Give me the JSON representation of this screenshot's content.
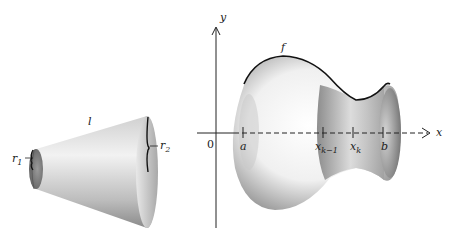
{
  "frustum": {
    "slant_label": "l",
    "r1_label": "r",
    "r1_sub": "1",
    "r2_label": "r",
    "r2_sub": "2"
  },
  "solid": {
    "y_axis_label": "y",
    "x_axis_label": "x",
    "origin_label": "0",
    "curve_label": "f",
    "ticks": [
      {
        "label": "a",
        "sub": ""
      },
      {
        "label": "x",
        "sub": "k−1"
      },
      {
        "label": "x",
        "sub": "k"
      },
      {
        "label": "b",
        "sub": ""
      }
    ]
  },
  "colors": {
    "stroke": "#222222",
    "shade_dark": "#6e6e6e",
    "shade_light": "#f4f4f4"
  }
}
